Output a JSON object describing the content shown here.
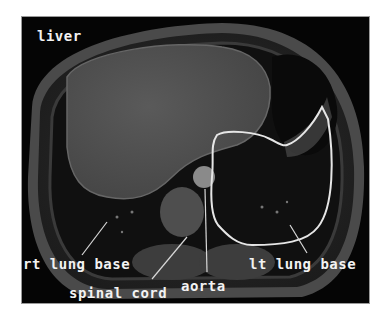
{
  "figure": {
    "outline_color": "#e6e6e6",
    "labels": {
      "liver": "liver",
      "rt_lung_base": "rt lung base",
      "lt_lung_base": "lt lung base",
      "spinal_cord": "spinal cord",
      "aorta": "aorta"
    }
  }
}
